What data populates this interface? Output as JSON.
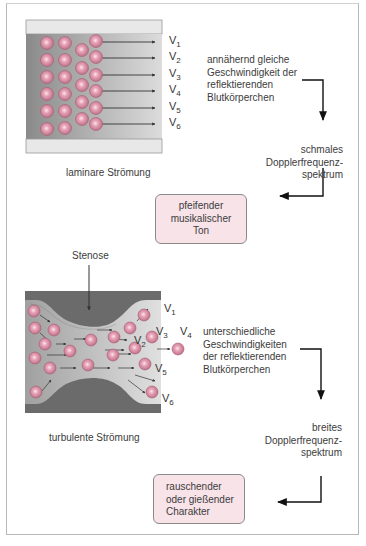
{
  "laminar": {
    "caption": "laminare Strömung",
    "velocity_labels": [
      "V1",
      "V2",
      "V3",
      "V4",
      "V5",
      "V6"
    ],
    "description": "annähernd gleiche\nGeschwindigkeit der\nreflektierenden\nBlutkörperchen",
    "spectrum": "schmales\nDopplerfrequenz-\nspektrum",
    "result_box": "pfeifender\nmusikalischer\nTon"
  },
  "turbulent": {
    "stenosis_label": "Stenose",
    "caption": "turbulente Strömung",
    "velocity_labels": [
      "V1",
      "V2",
      "V3",
      "V4",
      "V5",
      "V6"
    ],
    "description": "unterschiedliche\nGeschwindigkeiten\nder reflektierenden\nBlutkörperchen",
    "spectrum": "breites\nDopplerfrequenz-\nspektrum",
    "result_box": "rauschender\noder gießender\nCharakter"
  },
  "colors": {
    "vessel_wall": "#e6e6e6",
    "blood_dark": "#8c8c8c",
    "blood_light": "#d6d6d6",
    "stenosis": "#6a6a6a",
    "cell": "#d88aa0",
    "box_fill": "#f7e3e8"
  }
}
